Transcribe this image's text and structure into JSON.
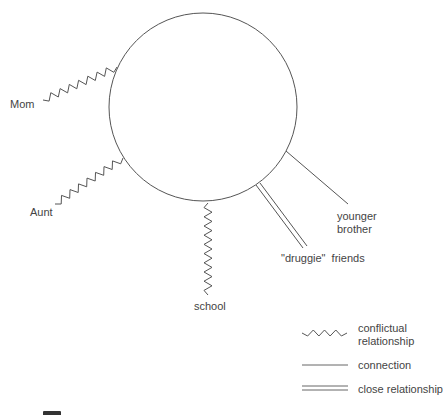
{
  "diagram": {
    "type": "ecomap",
    "center_node": {
      "label": ""
    },
    "relationships": [
      {
        "label": "Mom",
        "type": "conflictual"
      },
      {
        "label": "Aunt",
        "type": "conflictual"
      },
      {
        "label": "school",
        "type": "conflictual"
      },
      {
        "label": "\"druggie\"  friends",
        "type": "close"
      },
      {
        "label_lines": [
          "younger",
          "brother"
        ],
        "type": "connection"
      }
    ],
    "legend": [
      {
        "type": "conflictual",
        "label_lines": [
          "conflictual",
          "relationship"
        ]
      },
      {
        "type": "connection",
        "label": "connection"
      },
      {
        "type": "close",
        "label": "close relationship"
      }
    ],
    "colors": {
      "stroke": "#555555",
      "text": "#444444",
      "background": "#ffffff"
    }
  }
}
